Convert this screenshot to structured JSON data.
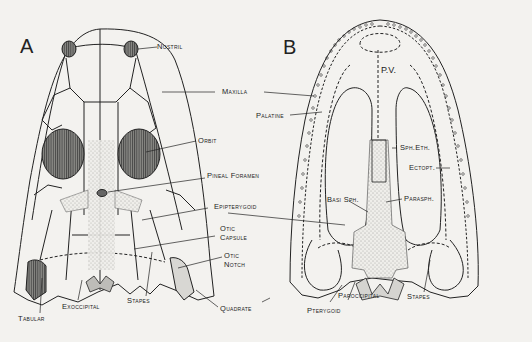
{
  "figure": {
    "panel_a": {
      "letter": "A",
      "labels": {
        "nostril": "Nostril",
        "maxilla": "Maxilla",
        "orbit": "Orbit",
        "pineal_foramen": "Pineal Foramen",
        "epipterygoid": "Epipterygoid",
        "otic_capsule_1": "Otic",
        "otic_capsule_2": "Capsule",
        "otic_notch_1": "Otic",
        "otic_notch_2": "Notch",
        "tabular": "Tabular",
        "exoccipital": "Exoccipital",
        "stapes": "Stapes",
        "quadrate": "Quadrate"
      }
    },
    "panel_b": {
      "letter": "B",
      "labels": {
        "pv": "P.V.",
        "palatine": "Palatine",
        "sph_eth": "Sph.Eth.",
        "ectopt": "Ectopt.",
        "basi_sph": "Basi Sph.",
        "parasph": "Parasph.",
        "pterygoid": "Pterygoid",
        "paroccipital": "Paroccipital",
        "stapes": "Stapes"
      }
    }
  }
}
